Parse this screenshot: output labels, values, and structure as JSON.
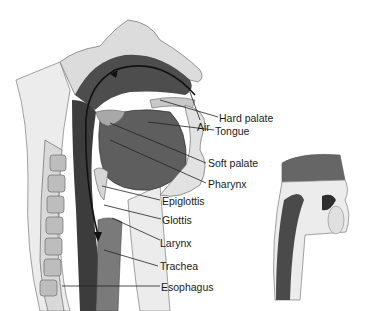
{
  "figure": {
    "title": "",
    "main_view": "Sagittal section of head and neck showing airway",
    "inset_view": "Sagittal section during swallowing"
  },
  "labels": [
    {
      "id": "air",
      "text": "Air"
    },
    {
      "id": "hard-palate",
      "text": "Hard palate"
    },
    {
      "id": "tongue",
      "text": "Tongue"
    },
    {
      "id": "soft-palate",
      "text": "Soft palate"
    },
    {
      "id": "pharynx",
      "text": "Pharynx"
    },
    {
      "id": "epiglottis",
      "text": "Epiglottis"
    },
    {
      "id": "glottis",
      "text": "Glottis"
    },
    {
      "id": "larynx",
      "text": "Larynx"
    },
    {
      "id": "trachea",
      "text": "Trachea"
    },
    {
      "id": "esophagus",
      "text": "Esophagus"
    }
  ],
  "colors": {
    "background": "#ffffff",
    "tissue_light": "#e6e6e6",
    "tissue_mid": "#b8b8b8",
    "tissue_dark": "#5a5a5a",
    "airway": "#3a3a3a",
    "outline": "#6b6b6b",
    "arrow": "#111111",
    "leader": "#222222"
  }
}
